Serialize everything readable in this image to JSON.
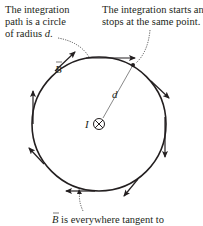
{
  "callouts": {
    "top_left": {
      "line1": "The integration",
      "line2": "path is a circle",
      "line3_prefix": "of radius ",
      "line3_var": "d",
      "line3_suffix": "."
    },
    "top_right": {
      "line1": "The integration starts and",
      "line2": "stops at the same point."
    },
    "bottom": {
      "vector": "B",
      "text": " is everywhere tangent to"
    }
  },
  "diagram": {
    "radius_label": "d",
    "current_label": "I",
    "field_label": "B",
    "current_symbol": "into-page",
    "colors": {
      "ink": "#231f20",
      "leader": "#444444"
    }
  }
}
